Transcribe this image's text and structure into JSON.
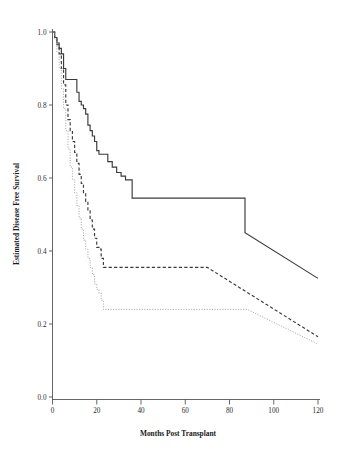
{
  "chart_data": {
    "type": "line",
    "title": "",
    "subtitle": "",
    "xlabel": "Months Post Transplant",
    "ylabel": "Estimated Disease Free Survival",
    "xlim": [
      0,
      120
    ],
    "ylim": [
      0.0,
      1.0
    ],
    "xticks": [
      0,
      20,
      40,
      60,
      80,
      100,
      120
    ],
    "xtick_labels": [
      "0",
      "20",
      "40",
      "60",
      "80",
      "100",
      "120"
    ],
    "yticks": [
      0.0,
      0.2,
      0.4,
      0.6,
      0.8,
      1.0
    ],
    "ytick_labels": [
      "0.0",
      "0.2",
      "0.4",
      "0.6",
      "0.8",
      "1.0"
    ],
    "grid": false,
    "legend": "none",
    "legend_position": "none",
    "annotations": [],
    "colors": {
      "group_1": "#3a3a3a",
      "group_2": "#3a3a3a",
      "group_3": "#9a9a9a",
      "axis": "#555555",
      "background": "#ffffff"
    },
    "series": [
      {
        "name": "group-1-solid",
        "style": "solid",
        "color": "#3a3a3a",
        "x": [
          0,
          1,
          2,
          3,
          4,
          5,
          6,
          7,
          9,
          11,
          12,
          13,
          14,
          15,
          16,
          17,
          18,
          19,
          20,
          21,
          23,
          25,
          27,
          29,
          31,
          33,
          36,
          74,
          87,
          120
        ],
        "values": [
          1.0,
          0.985,
          0.97,
          0.955,
          0.94,
          0.9,
          0.87,
          0.87,
          0.87,
          0.835,
          0.81,
          0.8,
          0.79,
          0.775,
          0.745,
          0.73,
          0.715,
          0.7,
          0.675,
          0.665,
          0.665,
          0.645,
          0.63,
          0.615,
          0.605,
          0.595,
          0.545,
          0.545,
          0.45,
          0.325
        ]
      },
      {
        "name": "group-2-dashed",
        "style": "dashed",
        "color": "#3a3a3a",
        "x": [
          0,
          1,
          2,
          3,
          4,
          5,
          6,
          7,
          8,
          9,
          10,
          11,
          12,
          13,
          14,
          15,
          16,
          17,
          18,
          19,
          20,
          21,
          22,
          23,
          70,
          120
        ],
        "values": [
          1.0,
          0.985,
          0.965,
          0.94,
          0.9,
          0.855,
          0.8,
          0.76,
          0.73,
          0.7,
          0.67,
          0.64,
          0.61,
          0.585,
          0.56,
          0.535,
          0.51,
          0.485,
          0.46,
          0.435,
          0.41,
          0.405,
          0.38,
          0.355,
          0.355,
          0.165
        ]
      },
      {
        "name": "group-3-dotted",
        "style": "dotted",
        "color": "#9a9a9a",
        "x": [
          0,
          1,
          2,
          3,
          4,
          5,
          6,
          7,
          8,
          9,
          10,
          11,
          12,
          13,
          14,
          15,
          16,
          17,
          18,
          19,
          20,
          21,
          22,
          23,
          88,
          120
        ],
        "values": [
          1.0,
          0.98,
          0.945,
          0.9,
          0.845,
          0.79,
          0.73,
          0.68,
          0.63,
          0.595,
          0.56,
          0.525,
          0.49,
          0.46,
          0.43,
          0.405,
          0.38,
          0.355,
          0.335,
          0.31,
          0.295,
          0.285,
          0.265,
          0.24,
          0.24,
          0.145
        ]
      }
    ]
  }
}
